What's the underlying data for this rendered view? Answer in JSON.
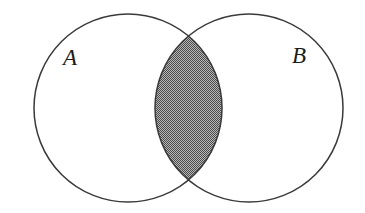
{
  "figure": {
    "name": "venn-diagram-two-sets",
    "kind": "venn-diagram",
    "width": 365,
    "height": 213,
    "background_color": "#ffffff"
  },
  "style": {
    "outline_color": "#3a3a3a",
    "outline_width": 1.5,
    "circle_fill": "#ffffff",
    "shade_dark_color": "#4a4a4a",
    "shade_light_color": "#b8b8b8",
    "shade_pattern": "checkerboard-dither-50",
    "label_color": "#1c1c1c",
    "label_font_size": 23,
    "label_font_style": "italic"
  },
  "sets": [
    {
      "id": "set-a",
      "label": "A",
      "label_x": 70,
      "label_y": 60,
      "circle": {
        "cx": 128,
        "cy": 108,
        "r": 94
      }
    },
    {
      "id": "set-b",
      "label": "B",
      "label_x": 299,
      "label_y": 58,
      "circle": {
        "cx": 249,
        "cy": 108,
        "r": 94
      }
    }
  ],
  "intersection": {
    "id": "intersection-region",
    "name": "A intersect B",
    "shaded": true,
    "top_point_x": 188,
    "top_point_y": 37,
    "bottom_point_x": 188,
    "bottom_point_y": 184,
    "left_extent_x": 155,
    "right_extent_x": 222
  }
}
